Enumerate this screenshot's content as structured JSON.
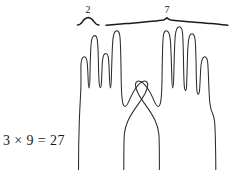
{
  "figure": {
    "background_color": "#ffffff",
    "ink_color": "#2b2b2b"
  },
  "braces": [
    {
      "id": "left-brace",
      "label": "2",
      "label_x": 88,
      "label_y": 13,
      "span_start_x": 77,
      "span_end_x": 100,
      "baseline_y": 24,
      "tip_y": 18,
      "meaning": "tens-group-count"
    },
    {
      "id": "right-brace",
      "label": "7",
      "label_x": 167,
      "label_y": 13,
      "span_start_x": 106,
      "span_end_x": 228,
      "baseline_y": 24,
      "tip_y": 18,
      "meaning": "ones-group-count"
    }
  ],
  "equation": {
    "text": "3 × 9 = 27",
    "x": 3,
    "y": 145,
    "left_factor": "3",
    "operator": "×",
    "right_factor": "9",
    "equals": "=",
    "product": "27"
  },
  "hands": [
    {
      "id": "left-hand",
      "side": "left",
      "fingers_up": 2,
      "fingers_down": 2,
      "thumb_direction": "inward-right",
      "description": "left hand with ring and index fingers extended, pinky and middle folded"
    },
    {
      "id": "right-hand",
      "side": "right",
      "fingers_up": 4,
      "fingers_down": 0,
      "thumb_direction": "inward-left",
      "description": "right hand with four fingers extended and thumb tucked inward"
    }
  ],
  "colors": {
    "ink": "#2b2b2b",
    "brace_ink": "#1a1a1a",
    "paper": "#ffffff"
  }
}
